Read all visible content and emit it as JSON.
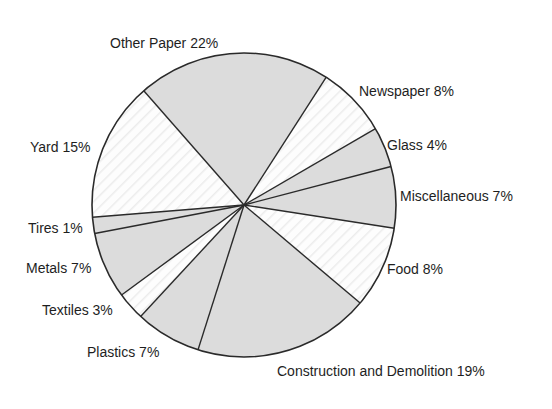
{
  "chart_data": {
    "type": "pie",
    "title": "",
    "categories": [
      "Other Paper",
      "Newspaper",
      "Glass",
      "Miscellaneous",
      "Food",
      "Construction and Demolition",
      "Plastics",
      "Textiles",
      "Metals",
      "Tires",
      "Yard"
    ],
    "values": [
      22,
      8,
      4,
      7,
      8,
      19,
      7,
      3,
      7,
      1,
      15
    ],
    "unit": "%",
    "labels": [
      "Other Paper 22%",
      "Newspaper 8%",
      "Glass 4%",
      "Miscellaneous 7%",
      "Food 8%",
      "Construction and Demolition 19%",
      "Plastics 7%",
      "Textiles 3%",
      "Metals 7%",
      "Tires 1%",
      "Yard 15%"
    ],
    "fills": [
      "gray",
      "white",
      "gray",
      "gray",
      "white",
      "gray",
      "gray",
      "white",
      "gray",
      "gray",
      "white"
    ],
    "legend": "none (direct labels)",
    "grid": false
  },
  "colors": {
    "gray_fill": "#dcdcdc",
    "white_fill": "#fdfdfd",
    "hatch": "#ececec",
    "outline": "#2a2a2a",
    "text": "#1e1e1e"
  },
  "geometry": {
    "cx": 244,
    "cy": 205,
    "r": 152,
    "boundaries": [
      [
        144,
        91
      ],
      [
        327,
        76
      ],
      [
        375,
        129
      ],
      [
        389,
        167
      ],
      [
        393,
        228
      ],
      [
        360,
        303
      ],
      [
        197,
        353
      ],
      [
        141,
        316
      ],
      [
        123,
        294
      ],
      [
        97,
        233
      ],
      [
        96,
        217
      ]
    ]
  },
  "label_positions": [
    {
      "x": 110,
      "y": 48
    },
    {
      "x": 359,
      "y": 96
    },
    {
      "x": 387,
      "y": 150
    },
    {
      "x": 400,
      "y": 201
    },
    {
      "x": 387,
      "y": 274
    },
    {
      "x": 277,
      "y": 376
    },
    {
      "x": 87,
      "y": 357
    },
    {
      "x": 42,
      "y": 315
    },
    {
      "x": 26,
      "y": 273
    },
    {
      "x": 28,
      "y": 233
    },
    {
      "x": 30,
      "y": 152
    }
  ]
}
